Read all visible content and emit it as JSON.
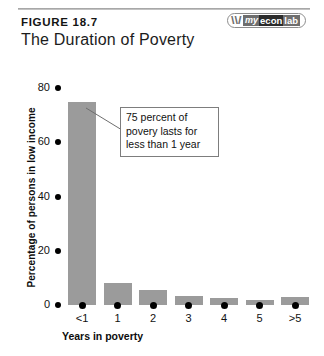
{
  "header": {
    "figure_label": "FIGURE 18.7",
    "title": "The Duration of Poverty",
    "logo": {
      "mark": "\\\\/",
      "my": "my",
      "econ": "econ",
      "lab": "lab"
    }
  },
  "annotation": {
    "text": "75 percent of povery lasts for less than 1 year"
  },
  "chart_data": {
    "type": "bar",
    "title": "The Duration of Poverty",
    "categories": [
      "<1",
      "1",
      "2",
      "3",
      "4",
      "5",
      ">5"
    ],
    "values": [
      75,
      8,
      5.5,
      3.5,
      2.5,
      2,
      3
    ],
    "xlabel": "Years in poverty",
    "ylabel": "Percentage of persons in low income",
    "ylim": [
      0,
      80
    ],
    "yticks": [
      0,
      20,
      40,
      60,
      80
    ],
    "ytick_labels": [
      "0",
      "20",
      "40",
      "60",
      "80"
    ],
    "grid": false,
    "legend": false,
    "bar_color": "#9b9b9b",
    "annotations": [
      {
        "text": "75 percent of povery lasts for less than 1 year",
        "points_to_category": "<1"
      }
    ]
  }
}
